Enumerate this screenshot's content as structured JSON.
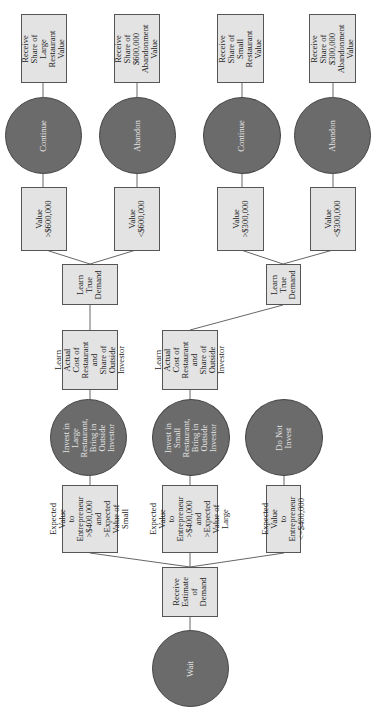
{
  "diagram": {
    "orientation": "rotated-90-ccw",
    "colors": {
      "decision_node": "#6b6b6b",
      "info_box": "#e3e3e3",
      "edge": "#555555"
    },
    "root": {
      "label": "Wait",
      "type": "decision"
    },
    "receive_estimate": {
      "label": "Receive\nEstimate of\nDemand",
      "type": "info"
    },
    "conditions": [
      {
        "label": "Expected Value\nto Entrepreneur\n>$400,000 and\n>Expected\nValue of Small"
      },
      {
        "label": "Expected Value\nto Entrepreneur\n>$400,000 and\n>Expected\nValue of Large"
      },
      {
        "label": "Expected Value\nto Entrepreneur\n<=$400,000"
      }
    ],
    "actions": [
      {
        "label": "Invest in Large\nRestaurant,\nBring in Outside\nInvestor"
      },
      {
        "label": "Invest in Small\nRestaurant,\nBring in\nOutside\nInvestor"
      },
      {
        "label": "Do Not\nInvest"
      }
    ],
    "learn_cost": [
      {
        "label": "Learn Actual\nCost of\nRestaurant and\nShare of\nOutside Investor"
      },
      {
        "label": "Learn Actual\nCost of\nRestaurant and\nShare of\nOutside Investor"
      }
    ],
    "learn_demand": [
      {
        "label": "Learn\nTrue\nDemand"
      },
      {
        "label": "Learn\nTrue\nDemand"
      }
    ],
    "value_conditions": [
      {
        "label": "Value\n>$600,000"
      },
      {
        "label": "Value\n<$600,000"
      },
      {
        "label": "Value\n>$300,000"
      },
      {
        "label": "Value\n<$300,000"
      }
    ],
    "final_decisions": [
      {
        "label": "Continue"
      },
      {
        "label": "Abandon"
      },
      {
        "label": "Continue"
      },
      {
        "label": "Abandon"
      }
    ],
    "outcomes": [
      {
        "label": "Receive Share of\nLarge\nRestaurant\nValue"
      },
      {
        "label": "Receive Share of\n$600,000\nAbandonment\nValue"
      },
      {
        "label": "Receive Share of\nSmall\nRestaurant\nValue"
      },
      {
        "label": "Receive Share of\n$300,000\nAbandonment\nValue"
      }
    ]
  }
}
